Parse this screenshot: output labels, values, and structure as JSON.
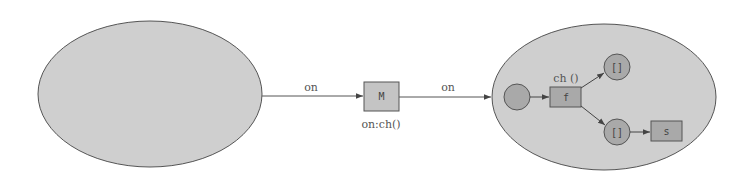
{
  "colors": {
    "background": "#ffffff",
    "ellipse_fill": "#cfcfcf",
    "node_fill": "#a9a9a9",
    "box_fill": "#c4c4c4",
    "stroke": "#555555",
    "text": "#555555"
  },
  "diagram": {
    "left_group": {
      "label": ""
    },
    "edge_left_to_m": {
      "label": "on"
    },
    "node_m": {
      "label": "M",
      "caption": "on:ch()"
    },
    "edge_m_to_right": {
      "label": "on"
    },
    "right_group": {
      "start_node": {
        "label": ""
      },
      "node_f": {
        "label": "f",
        "caption": "ch ()"
      },
      "node_upper": {
        "label": "[]"
      },
      "node_lower": {
        "label": "[]"
      },
      "node_s": {
        "label": "s"
      }
    }
  }
}
